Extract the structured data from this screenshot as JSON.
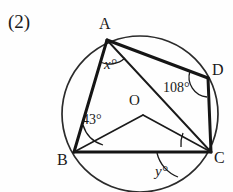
{
  "figure": {
    "problem_number": "(2)",
    "type": "circle-geometry-diagram",
    "circle": {
      "center_label": "O",
      "cx": 140,
      "cy": 114,
      "r": 78,
      "stroke": "#1a1a1a"
    },
    "vertices": [
      {
        "name": "A",
        "label": "A",
        "x": 107,
        "y": 40
      },
      {
        "name": "D",
        "label": "D",
        "x": 208,
        "y": 78
      },
      {
        "name": "C",
        "label": "C",
        "x": 211,
        "y": 152
      },
      {
        "name": "B",
        "label": "B",
        "x": 74,
        "y": 152
      },
      {
        "name": "O",
        "label": "O",
        "x": 143,
        "y": 115
      }
    ],
    "segments": [
      {
        "name": "segment-AB",
        "from": "A",
        "to": "B",
        "weight": "thick"
      },
      {
        "name": "segment-AD",
        "from": "A",
        "to": "D",
        "weight": "thick"
      },
      {
        "name": "segment-DC",
        "from": "D",
        "to": "C",
        "weight": "thick"
      },
      {
        "name": "segment-BC",
        "from": "B",
        "to": "C",
        "weight": "thick"
      },
      {
        "name": "segment-AC",
        "from": "A",
        "to": "C",
        "weight": "thin"
      },
      {
        "name": "segment-OB",
        "from": "O",
        "to": "B",
        "weight": "thin"
      },
      {
        "name": "segment-OC",
        "from": "O",
        "to": "C",
        "weight": "thin"
      }
    ],
    "angles": [
      {
        "name": "angle-x",
        "vertex": "A",
        "value": "x",
        "unit": "°",
        "text": "x°",
        "between": [
          "AB",
          "AC"
        ],
        "known": false
      },
      {
        "name": "angle-108",
        "vertex": "D",
        "value": "108",
        "unit": "°",
        "text": "108°",
        "between": [
          "DA",
          "DC"
        ],
        "known": true
      },
      {
        "name": "angle-43",
        "vertex": "B",
        "value": "43",
        "unit": "°",
        "text": "43°",
        "between": [
          "BA",
          "BO"
        ],
        "known": true
      },
      {
        "name": "angle-y",
        "vertex": "C",
        "value": "y",
        "unit": "°",
        "text": "y°",
        "between": [
          "CA",
          "CO"
        ],
        "known": false
      }
    ],
    "colors": {
      "ink": "#1a1a1a",
      "paper": "#fefefe",
      "arc": "#2b2b2b"
    }
  }
}
